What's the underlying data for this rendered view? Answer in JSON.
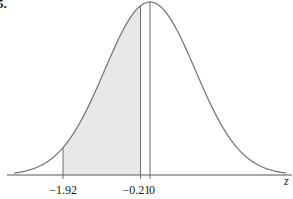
{
  "problem_number": "5.",
  "chart_data": {
    "type": "area",
    "title": "",
    "xlabel": "z",
    "ylabel": "",
    "distribution": "standard normal",
    "mean": 0,
    "std": 1,
    "shaded_region": {
      "from": -1.92,
      "to": -0.21
    },
    "vertical_lines": [
      -1.92,
      -0.21,
      0
    ],
    "tick_labels": [
      "−1.92",
      "−0.21",
      "0"
    ],
    "tick_values": [
      -1.92,
      -0.21,
      0
    ],
    "grid": false,
    "legend": null,
    "xlim": [
      -3.2,
      3.2
    ]
  },
  "colors": {
    "curve": "#7a7a7a",
    "shade": "#e8e8e8",
    "axis": "#555555",
    "lines": "#6e6e6e"
  },
  "labels": {
    "tick_neg192": "−1.92",
    "tick_neg021": "−0.21",
    "tick_zero": "0",
    "axis_var": "z"
  }
}
